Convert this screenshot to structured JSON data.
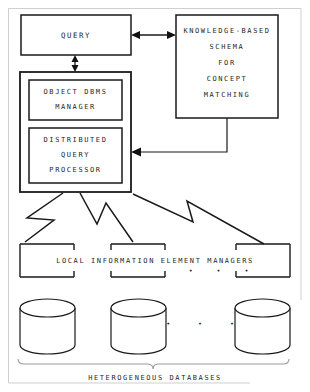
{
  "diagram": {
    "title_caption": "HETEROGENEOUS DATABASES",
    "nodes": {
      "query": {
        "label": "QUERY",
        "name": "query-box"
      },
      "knowledge_schema": {
        "lines": [
          "KNOWLEDGE-BASED",
          "SCHEMA",
          "FOR",
          "CONCEPT",
          "MATCHING"
        ],
        "line1": "KNOWLEDGE-BASED",
        "line2": "SCHEMA",
        "line3": "FOR",
        "line4": "CONCEPT",
        "line5": "MATCHING",
        "name": "knowledge-based-schema-box"
      },
      "object_dbms_manager": {
        "line1": "OBJECT DBMS",
        "line2": "MANAGER",
        "name": "object-dbms-manager-box"
      },
      "distributed_query_processor": {
        "line1": "DISTRIBUTED",
        "line2": "QUERY",
        "line3": "PROCESSOR",
        "name": "distributed-query-processor-box"
      },
      "local_managers": {
        "label": "LOCAL INFORMATION ELEMENT MANAGERS",
        "ellipsis": "•   •   •",
        "count": 3,
        "name": "local-information-element-managers"
      },
      "databases": {
        "ellipsis": "•   •   •",
        "count": 3,
        "caption": "HETEROGENEOUS DATABASES",
        "name": "heterogeneous-databases"
      }
    },
    "connectors": {
      "query_to_schema": {
        "type": "double-arrow-horizontal"
      },
      "query_to_dbms": {
        "type": "double-arrow-vertical"
      },
      "schema_to_processor": {
        "type": "elbow-arrow-left"
      },
      "processor_to_managers": {
        "type": "zigzag",
        "count": 3
      }
    },
    "colors": {
      "stroke": "#1a1a1a",
      "background": "#ffffff",
      "border": "#bdbdbd",
      "text": "#1f1f1f"
    }
  }
}
